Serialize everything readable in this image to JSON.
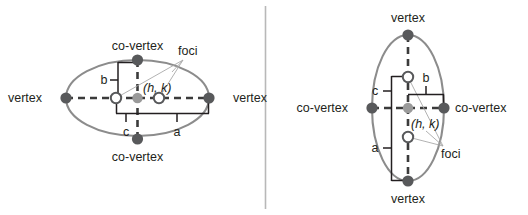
{
  "figure": {
    "divider": {
      "name": "panel-divider",
      "color": "#b8b8b8"
    }
  },
  "colors": {
    "ellipse_stroke": "#8c8c8c",
    "vertex_dot": "#58595b",
    "center_dot": "#9a9a9a",
    "focus_ring": "#58595b",
    "focus_fill": "#ffffff",
    "axis_dash": "#3b3b3b",
    "measure_line": "#231f20",
    "leader_line": "#a9a9a9",
    "text": "#231f20",
    "background": "#ffffff"
  },
  "left_panel": {
    "name": "horizontal-ellipse-diagram",
    "orientation": "horizontal-major-axis",
    "labels": {
      "vertex_left": "vertex",
      "vertex_right": "vertex",
      "covertex_top": "co-vertex",
      "covertex_bottom": "co-vertex",
      "foci": "foci",
      "center": "(h, k)",
      "a": "a",
      "b": "b",
      "c": "c"
    }
  },
  "right_panel": {
    "name": "vertical-ellipse-diagram",
    "orientation": "vertical-major-axis",
    "labels": {
      "vertex_top": "vertex",
      "vertex_bottom": "vertex",
      "covertex_left": "co-vertex",
      "covertex_right": "co-vertex",
      "foci": "foci",
      "center": "(h, k)",
      "a": "a",
      "b": "b",
      "c": "c"
    }
  }
}
